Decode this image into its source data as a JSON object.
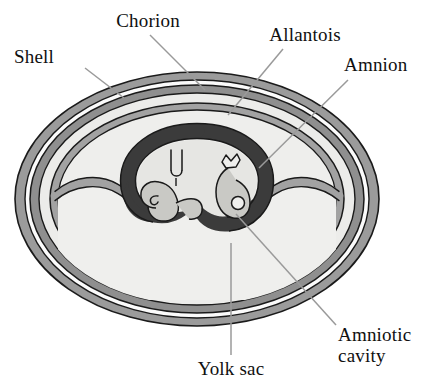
{
  "figure": {
    "background_color": "#ffffff"
  },
  "palette": {
    "outline": "#1a1a1a",
    "shell_band": "#9b9b9b",
    "chorion_band": "#8f8f8f",
    "allantois_band": "#a2a2a2",
    "amnion_band": "#3b3b3b",
    "interior_light": "#e9e9e7",
    "interior_lighter": "#f1f1ef",
    "embryo_fill": "#c9c9c5",
    "gap_white": "#fbfbfb",
    "leader_line": "#9a9a9a",
    "text": "#101010"
  },
  "labels": [
    {
      "id": "chorion",
      "name": "Chorion",
      "text": "Chorion",
      "x": 148,
      "y": 22,
      "align": "center",
      "leader": {
        "x1": 150,
        "y1": 35,
        "x2": 205,
        "y2": 90
      }
    },
    {
      "id": "allantois",
      "name": "Allantois",
      "text": "Allantois",
      "x": 305,
      "y": 36,
      "align": "center",
      "leader": {
        "x1": 283,
        "y1": 49,
        "x2": 228,
        "y2": 115
      }
    },
    {
      "id": "shell",
      "name": "Shell",
      "text": "Shell",
      "x": 38,
      "y": 58,
      "align": "left",
      "leader": {
        "x1": 85,
        "y1": 68,
        "x2": 124,
        "y2": 98
      }
    },
    {
      "id": "amnion",
      "name": "Amnion",
      "text": "Amnion",
      "x": 351,
      "y": 66,
      "align": "left",
      "leader": {
        "x1": 348,
        "y1": 80,
        "x2": 259,
        "y2": 168
      }
    },
    {
      "id": "amniotic-cavity",
      "name": "Amniotic cavity",
      "text": "Amniotic\ncavity",
      "x": 338,
      "y": 330,
      "align": "left",
      "leader": {
        "x1": 336,
        "y1": 325,
        "x2": 236,
        "y2": 214
      }
    },
    {
      "id": "yolk-sac",
      "name": "Yolk sac",
      "text": "Yolk sac",
      "x": 231,
      "y": 362,
      "align": "center",
      "leader": {
        "x1": 231,
        "y1": 355,
        "x2": 231,
        "y2": 243
      }
    }
  ],
  "structures": [
    {
      "id": "shell",
      "name": "Shell",
      "description": "Outermost gray oval band"
    },
    {
      "id": "shell-membrane-gap",
      "name": "Shell membrane gap",
      "description": "White ring inside shell"
    },
    {
      "id": "chorion",
      "name": "Chorion",
      "description": "Second gray oval band"
    },
    {
      "id": "allantois",
      "name": "Allantois",
      "description": "Inner gray band enclosing allantoic cavity"
    },
    {
      "id": "amnion",
      "name": "Amnion",
      "description": "Thick dark ring around the embryo"
    },
    {
      "id": "amniotic-cavity",
      "name": "Amniotic cavity",
      "description": "Light space inside the amnion"
    },
    {
      "id": "yolk-sac",
      "name": "Yolk sac",
      "description": "Large light region in lower half of egg"
    },
    {
      "id": "embryo-left",
      "name": "Embryo (left coil)",
      "description": "Spiral coiled embryo form"
    },
    {
      "id": "embryo-right",
      "name": "Embryo (right coil)",
      "description": "Hooked embryo form with eye circle"
    }
  ]
}
